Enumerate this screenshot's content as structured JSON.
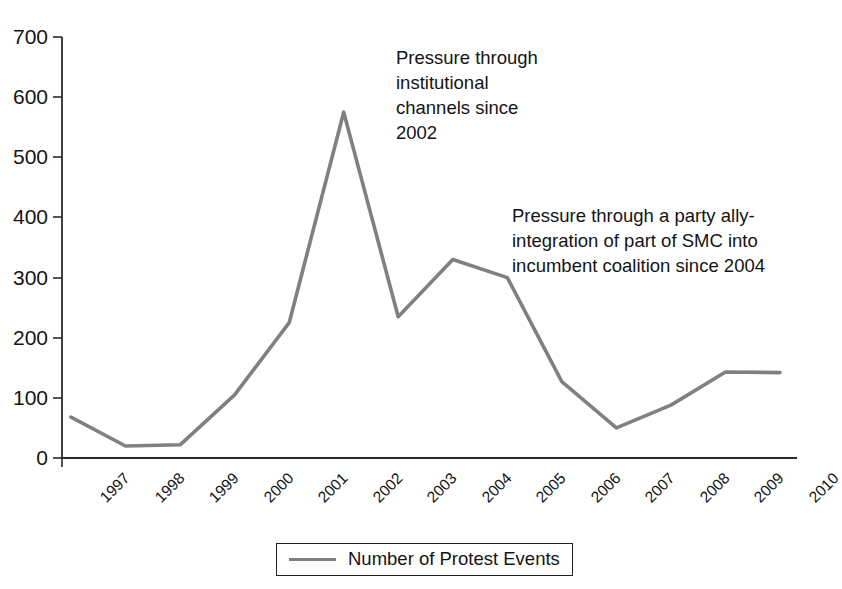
{
  "chart_data": {
    "type": "line",
    "title": "",
    "xlabel": "",
    "ylabel": "",
    "categories": [
      "1997",
      "1998",
      "1999",
      "2000",
      "2001",
      "2002",
      "2003",
      "2004",
      "2005",
      "2006",
      "2007",
      "2008",
      "2009",
      "2010"
    ],
    "series": [
      {
        "name": "Number of Protest Events",
        "color": "#808080",
        "values": [
          68,
          20,
          22,
          105,
          225,
          575,
          235,
          330,
          300,
          127,
          50,
          88,
          143,
          142
        ]
      }
    ],
    "ylim": [
      0,
      700
    ],
    "yticks": [
      0,
      100,
      200,
      300,
      400,
      500,
      600,
      700
    ],
    "ytick_labels": [
      "0",
      "100",
      "200",
      "300",
      "400",
      "500",
      "600",
      "700"
    ],
    "grid": false,
    "legend_position": "bottom",
    "annotations": [
      {
        "id": "annotation-1",
        "text": "Pressure through\ninstitutional\nchannels since\n2002"
      },
      {
        "id": "annotation-2",
        "text": "Pressure through a party ally-\nintegration of part of SMC into\nincumbent coalition since 2004"
      }
    ]
  },
  "legend": {
    "label": "Number of Protest Events",
    "swatch": "line-swatch"
  },
  "axes": {
    "y_labels": [
      "700",
      "600",
      "500",
      "400",
      "300",
      "200",
      "100",
      "0"
    ],
    "x_labels": [
      "1997",
      "1998",
      "1999",
      "2000",
      "2001",
      "2002",
      "2003",
      "2004",
      "2005",
      "2006",
      "2007",
      "2008",
      "2009",
      "2010"
    ]
  }
}
